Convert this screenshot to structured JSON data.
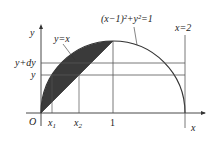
{
  "diagram": {
    "type": "region-between-curves",
    "labels": {
      "y_axis": "y",
      "x_axis": "x",
      "origin": "O",
      "line_y_eq_x": "y=x",
      "circle_eq": "(x−1)²+y²=1",
      "vertical_line": "x=2",
      "y_plus_dy": "y+dy",
      "y_level": "y",
      "x1_main": "x",
      "x1_sub": "1",
      "x2_main": "x",
      "x2_sub": "2",
      "tick_one": "1"
    },
    "colors": {
      "shade": "#3a3a3a",
      "stroke": "#333333",
      "thin": "#555555"
    },
    "geometry": {
      "origin_px": [
        41,
        113
      ],
      "unit_px": 72,
      "y_plus_dy_value": 0.69,
      "y_value": 0.53
    }
  }
}
